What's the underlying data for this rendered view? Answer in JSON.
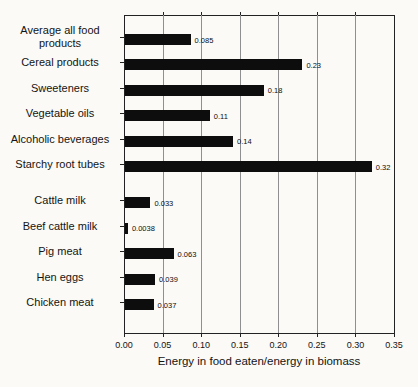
{
  "chart_data": {
    "type": "bar",
    "orientation": "horizontal",
    "title": "",
    "xlabel": "Energy in food eaten/energy in biomass",
    "ylabel": "",
    "categories": [
      "Average all food products",
      "Cereal products",
      "Sweeteners",
      "Vegetable oils",
      "Alcoholic beverages",
      "Starchy root tubes",
      "Cattle milk",
      "Beef cattle milk",
      "Pig meat",
      "Hen eggs",
      "Chicken meat"
    ],
    "values": [
      0.085,
      0.23,
      0.18,
      0.11,
      0.14,
      0.32,
      0.033,
      0.0038,
      0.063,
      0.039,
      0.037
    ],
    "value_labels": [
      "0.085",
      "0.23",
      "0.18",
      "0.11",
      "0.14",
      "0.32",
      "0.033",
      "0.0038",
      "0.063",
      "0.039",
      "0.037"
    ],
    "group_gap_after": "Starchy root tubes",
    "group_gap_after_index": 5,
    "x_ticks": [
      "0.00",
      "0.05",
      "0.10",
      "0.15",
      "0.20",
      "0.25",
      "0.30",
      "0.35"
    ],
    "xlim": [
      0,
      0.35
    ],
    "x_tick_step": 0.05,
    "grid": "vertical",
    "legend": "none",
    "bar_color": "#0d0d0d",
    "grid_color": "#8f8f8f",
    "axis_color": "#222222",
    "background_color": "#fbfaf7"
  }
}
